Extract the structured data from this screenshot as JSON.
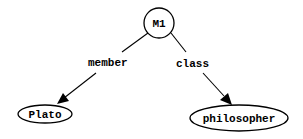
{
  "diagram": {
    "type": "semantic-network",
    "nodes": [
      {
        "id": "M1",
        "label": "M1",
        "shape": "circle"
      },
      {
        "id": "Plato",
        "label": "Plato",
        "shape": "ellipse"
      },
      {
        "id": "philosopher",
        "label": "philosopher",
        "shape": "ellipse"
      }
    ],
    "edges": [
      {
        "from": "M1",
        "to": "Plato",
        "label": "member"
      },
      {
        "from": "M1",
        "to": "philosopher",
        "label": "class"
      }
    ]
  }
}
